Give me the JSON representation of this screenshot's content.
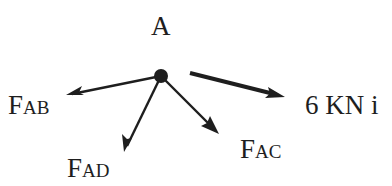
{
  "diagram": {
    "type": "free-body-diagram",
    "node": {
      "label": "A",
      "x": 161,
      "y": 76,
      "r": 7
    },
    "colors": {
      "ink": "#1e1e1e",
      "background": "#ffffff"
    },
    "forces": [
      {
        "id": "fab",
        "label_main": "F",
        "label_sub": "AB",
        "from": [
          161,
          76
        ],
        "to": [
          66,
          95
        ],
        "stroke_width": 2.4
      },
      {
        "id": "fad",
        "label_main": "F",
        "label_sub": "AD",
        "from": [
          161,
          76
        ],
        "to": [
          124,
          152
        ],
        "stroke_width": 2.4
      },
      {
        "id": "fac",
        "label_main": "F",
        "label_sub": "AC",
        "from": [
          161,
          76
        ],
        "to": [
          219,
          134
        ],
        "stroke_width": 2.4
      },
      {
        "id": "load",
        "label_main": "6 KN i",
        "from": [
          190,
          73
        ],
        "to": [
          285,
          97
        ],
        "stroke_width": 4.2
      }
    ]
  }
}
